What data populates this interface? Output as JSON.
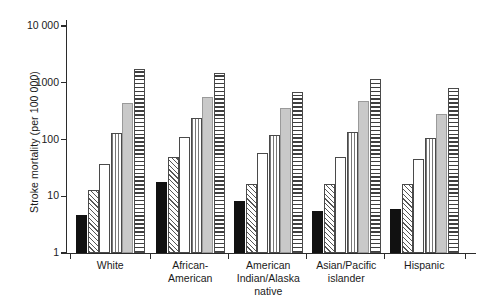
{
  "chart_data": {
    "type": "bar",
    "title": "",
    "xlabel": "",
    "ylabel": "Stroke mortality (per 100 000)",
    "yscale": "log",
    "ylim": [
      1,
      10000
    ],
    "ytick_labels": [
      "10 000",
      "1000",
      "100",
      "10",
      "1"
    ],
    "ytick_values": [
      10000,
      1000,
      100,
      10,
      1
    ],
    "grid": false,
    "legend": "none",
    "categories": [
      "White",
      "African-\nAmerican",
      "American\nIndian/Alaska\nnative",
      "Asian/Pacific\nislander",
      "Hispanic"
    ],
    "series": [
      {
        "name": "series-1",
        "fill": "solid-black",
        "values": [
          4.7,
          18,
          8.2,
          5.6,
          6.0
        ]
      },
      {
        "name": "series-2",
        "fill": "diagonal-hatch",
        "values": [
          12.7,
          49,
          16.6,
          16.2,
          16.2
        ]
      },
      {
        "name": "series-3",
        "fill": "white",
        "values": [
          37.5,
          110,
          58.5,
          49,
          44.8
        ]
      },
      {
        "name": "series-4",
        "fill": "vertical-lines",
        "values": [
          129,
          242,
          120,
          136,
          105
        ]
      },
      {
        "name": "series-5",
        "fill": "solid-gray",
        "values": [
          435,
          568,
          363,
          477,
          285
        ]
      },
      {
        "name": "series-6",
        "fill": "horizontal-lines",
        "values": [
          1770,
          1500,
          687,
          1178,
          819
        ]
      }
    ]
  },
  "colors": {
    "axis": "#2b2b2b",
    "black_bar": "#111111",
    "gray_bar": "#c9c9c9",
    "background": "#ffffff"
  }
}
